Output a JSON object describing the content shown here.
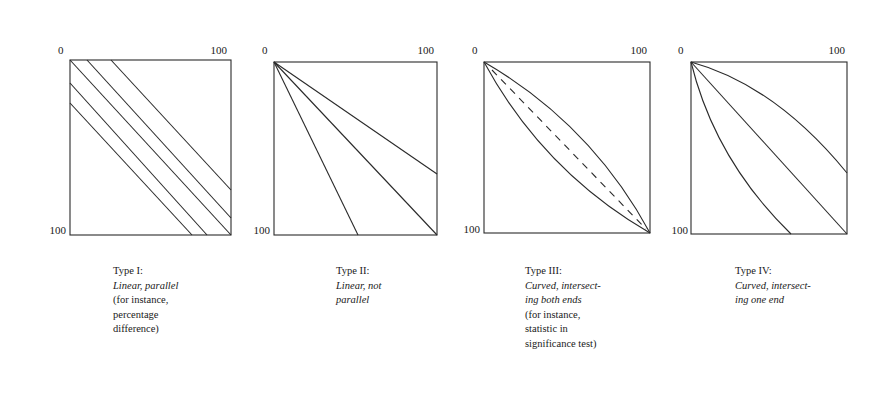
{
  "figure": {
    "panels": [
      {
        "id": "type-1",
        "axis": {
          "top_left": "0",
          "top_right": "100",
          "bottom_left": "100"
        },
        "caption": {
          "title": "Type I:",
          "description_lines": [
            "Linear, parallel"
          ],
          "example_lines": [
            "(for instance,",
            "percentage",
            "difference)"
          ]
        }
      },
      {
        "id": "type-2",
        "axis": {
          "top_left": "0",
          "top_right": "100",
          "bottom_left": "100"
        },
        "caption": {
          "title": "Type II:",
          "description_lines": [
            "Linear, not",
            "parallel"
          ],
          "example_lines": []
        }
      },
      {
        "id": "type-3",
        "axis": {
          "top_left": "0",
          "top_right": "100",
          "bottom_left": "100"
        },
        "caption": {
          "title": "Type III:",
          "description_lines": [
            "Curved, intersect-",
            "ing both ends"
          ],
          "example_lines": [
            "(for instance,",
            "statistic in",
            "significance test)"
          ]
        }
      },
      {
        "id": "type-4",
        "axis": {
          "top_left": "0",
          "top_right": "100",
          "bottom_left": "100"
        },
        "caption": {
          "title": "Type IV:",
          "description_lines": [
            "Curved, intersect-",
            "ing one end"
          ],
          "example_lines": []
        }
      }
    ]
  }
}
